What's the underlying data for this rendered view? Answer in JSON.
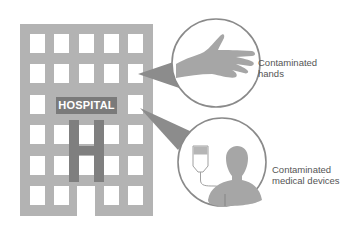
{
  "building": {
    "sign_text": "HOSPITAL",
    "letter": "H",
    "colors": {
      "wall": "#b3b3b3",
      "window": "#ffffff",
      "sign": "#7a7a7a",
      "letter": "#7f7f7f"
    }
  },
  "callouts": [
    {
      "id": "hands",
      "icon": "hand-icon",
      "label_line1": "Contaminated",
      "label_line2": "hands"
    },
    {
      "id": "devices",
      "icon": "patient-iv-icon",
      "label_line1": "Contaminated",
      "label_line2": "medical devices"
    }
  ],
  "colors": {
    "pointer": "#8c8c8c",
    "circle_stroke": "#8a8a8a",
    "icon_fill": "#a6a6a6"
  }
}
